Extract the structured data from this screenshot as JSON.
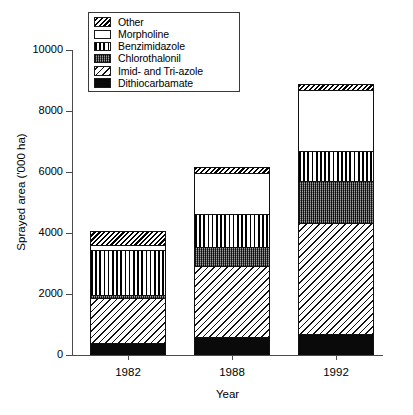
{
  "chart_data": {
    "type": "bar",
    "stacked": true,
    "title": "",
    "subtitle": "",
    "xlabel": "Year",
    "ylabel": "Sprayed area ('000 ha)",
    "categories": [
      "1982",
      "1988",
      "1992"
    ],
    "ylim": [
      0,
      10000
    ],
    "yticks": [
      0,
      2000,
      4000,
      6000,
      8000,
      10000
    ],
    "ytick_labels": [
      "0",
      "2000",
      "4000",
      "6000",
      "8000",
      "10000"
    ],
    "grid": false,
    "legend_position": "top-center-inside",
    "series": [
      {
        "name": "Other",
        "pattern": "dense-diagonal-hatch",
        "values": [
          430,
          170,
          200
        ]
      },
      {
        "name": "Morpholine",
        "pattern": "white-empty",
        "values": [
          170,
          1360,
          2000
        ]
      },
      {
        "name": "Benzimidazole",
        "pattern": "vertical-stripes",
        "values": [
          1470,
          1080,
          1000
        ]
      },
      {
        "name": "Chlorothalonil",
        "pattern": "dark-stipple",
        "values": [
          100,
          610,
          1380
        ]
      },
      {
        "name": "Imid- and Tri-azole",
        "pattern": "sparse-diagonal-hatch",
        "values": [
          1480,
          2350,
          3620
        ]
      },
      {
        "name": "Dithiocarbamate",
        "pattern": "solid-black",
        "values": [
          400,
          580,
          700
        ]
      }
    ],
    "totals": [
      4050,
      6150,
      8900
    ],
    "stack_order_bottom_to_top": [
      "Dithiocarbamate",
      "Imid- and Tri-azole",
      "Chlorothalonil",
      "Benzimidazole",
      "Morpholine",
      "Other"
    ]
  },
  "legend": {
    "items": [
      {
        "label": "Other"
      },
      {
        "label": "Morpholine"
      },
      {
        "label": "Benzimidazole"
      },
      {
        "label": "Chlorothalonil"
      },
      {
        "label": "Imid- and Tri-azole"
      },
      {
        "label": "Dithiocarbamate"
      }
    ]
  },
  "axes": {
    "y": {
      "label": "Sprayed area ('000 ha)",
      "ticks": [
        "10000",
        "8000",
        "6000",
        "4000",
        "2000",
        "0"
      ]
    },
    "x": {
      "label": "Year",
      "ticks": [
        "1982",
        "1988",
        "1992"
      ]
    }
  }
}
